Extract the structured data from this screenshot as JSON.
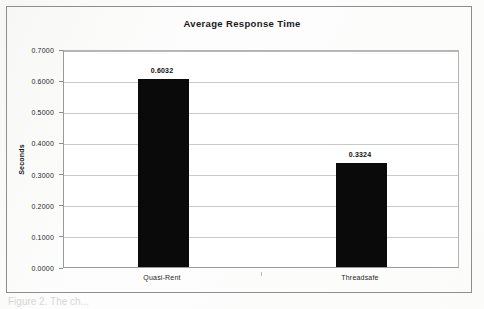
{
  "chart_data": {
    "type": "bar",
    "title": "Average Response Time",
    "xlabel": "",
    "ylabel": "Seconds",
    "categories": [
      "Quasi-Rent",
      "Threadsafe"
    ],
    "values": [
      0.6032,
      0.3324
    ],
    "value_labels": [
      "0.6032",
      "0.3324"
    ],
    "ylim": [
      0.0,
      0.7
    ],
    "ytick_values": [
      0.0,
      0.1,
      0.2,
      0.3,
      0.4,
      0.5,
      0.6,
      0.7
    ],
    "ytick_labels": [
      "0.0000",
      "0.1000",
      "0.2000",
      "0.3000",
      "0.4000",
      "0.5000",
      "0.6000",
      "0.7000"
    ],
    "grid": true,
    "grid_axis": "y",
    "legend": false,
    "legend_position": "none",
    "series": [
      {
        "name": "Average Response Time",
        "color": "#0a0a0a",
        "values": [
          0.6032,
          0.3324
        ]
      }
    ],
    "colors": {
      "bar": "#0a0a0a",
      "gridline": "#c9c9c9",
      "axis": "#9a9a9a",
      "frame": "#8e8e8e",
      "text": "#1a1a1a",
      "background": "#ffffff",
      "page_background": "#fdfdfd"
    }
  },
  "figure": {
    "caption_fragment": "Figure 2.  The ch..."
  }
}
